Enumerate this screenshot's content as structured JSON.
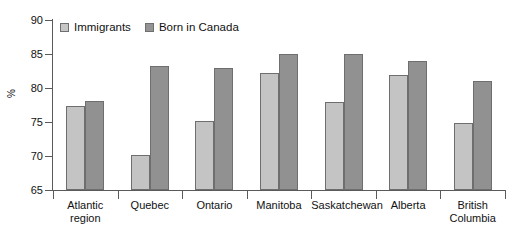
{
  "chart_data": {
    "type": "bar",
    "title": "",
    "subtitle": "",
    "xlabel": "",
    "ylabel": "%",
    "ylim": [
      65,
      90
    ],
    "ytick_step": 5,
    "yticks": [
      90,
      85,
      80,
      75,
      70,
      65
    ],
    "ytick_labels": [
      "90",
      "85",
      "80",
      "75",
      "70",
      "65"
    ],
    "grid": false,
    "legend_position": "top-left-inside",
    "categories": [
      "Atlantic\nregion",
      "Quebec",
      "Ontario",
      "Manitoba",
      "Saskatchewan",
      "Alberta",
      "British\nColumbia"
    ],
    "series": [
      {
        "name": "Immigrants",
        "color": "#c4c4c4",
        "values": [
          77.3,
          70.2,
          75.2,
          82.2,
          78.0,
          81.9,
          74.9
        ]
      },
      {
        "name": "Born in Canada",
        "color": "#919191",
        "values": [
          78.1,
          83.3,
          83.0,
          85.0,
          85.0,
          84.0,
          81.0
        ]
      }
    ]
  },
  "legend": {
    "items": [
      {
        "label": "Immigrants"
      },
      {
        "label": "Born in Canada"
      }
    ]
  },
  "colors": {
    "immigrants": "#c4c4c4",
    "born_in_canada": "#919191",
    "axis": "#5a5a5a",
    "text": "#111111",
    "background": "#ffffff"
  }
}
